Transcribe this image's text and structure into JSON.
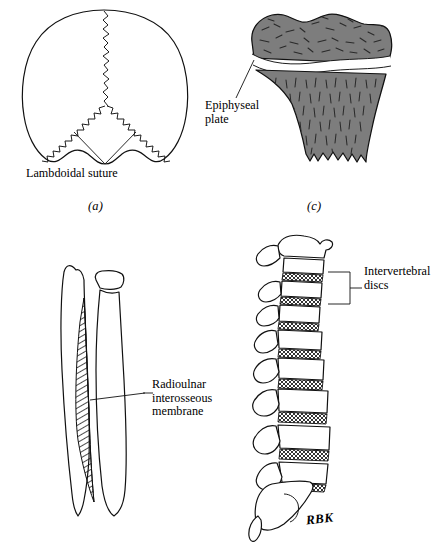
{
  "figure": {
    "signature": "RBK",
    "ink_color": "#111111",
    "bone_gray": "#7d7d7d",
    "background": "#ffffff"
  },
  "panels": [
    {
      "id": "a",
      "caption": "(a)",
      "subject": "posterior-skull",
      "labels": [
        {
          "text": "Lambdoidal suture"
        }
      ]
    },
    {
      "id": "c",
      "caption": "(c)",
      "subject": "long-bone-epiphysis",
      "labels": [
        {
          "line1": "Epiphyseal",
          "line2": "plate"
        }
      ]
    },
    {
      "id": "b",
      "caption": "",
      "subject": "radius-ulna-interosseous-membrane",
      "labels": [
        {
          "line1": "Radioulnar",
          "line2": "interosseous",
          "line3": "membrane"
        }
      ]
    },
    {
      "id": "d",
      "caption": "",
      "subject": "lumbar-vertebral-column",
      "labels": [
        {
          "line1": "Intervertebral",
          "line2": "discs"
        }
      ]
    }
  ]
}
